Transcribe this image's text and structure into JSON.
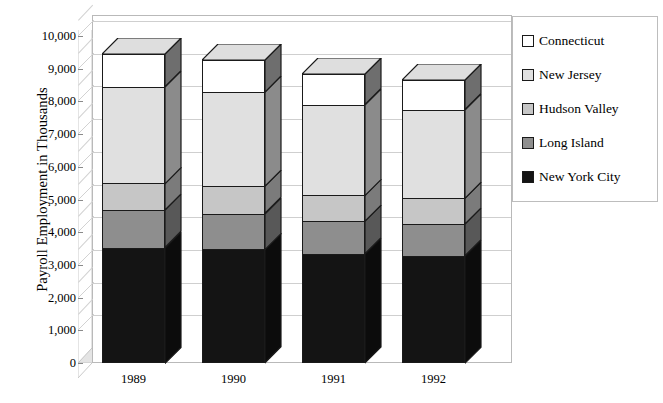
{
  "chart_data": {
    "type": "bar",
    "subtype": "stacked-3d-column",
    "title": "",
    "xlabel": "",
    "ylabel": "Payroll Employment in Thousands",
    "categories": [
      "1989",
      "1990",
      "1991",
      "1992"
    ],
    "ylim": [
      0,
      10000
    ],
    "ytick_labels": [
      "0",
      "1,000",
      "2,000",
      "3,000",
      "4,000",
      "5,000",
      "6,000",
      "7,000",
      "8,000",
      "9,000",
      "10,000"
    ],
    "ytick_values": [
      0,
      1000,
      2000,
      3000,
      4000,
      5000,
      6000,
      7000,
      8000,
      9000,
      10000
    ],
    "grid": true,
    "legend_position": "right",
    "stack_order_bottom_to_top": [
      "New York City",
      "Long Island",
      "Hudson Valley",
      "New Jersey",
      "Connecticut"
    ],
    "series": [
      {
        "name": "New York City",
        "color": "#141414",
        "values": [
          3530,
          3480,
          3330,
          3280
        ]
      },
      {
        "name": "Long Island",
        "color": "#8e8e8e",
        "values": [
          1140,
          1090,
          1000,
          970
        ]
      },
      {
        "name": "Hudson Valley",
        "color": "#c6c6c6",
        "values": [
          820,
          830,
          800,
          790
        ]
      },
      {
        "name": "New Jersey",
        "color": "#e0e0e0",
        "values": [
          2960,
          2880,
          2770,
          2700
        ]
      },
      {
        "name": "Connecticut",
        "color": "#ffffff",
        "values": [
          1000,
          980,
          930,
          900
        ]
      }
    ],
    "totals": [
      9450,
      9260,
      8830,
      8640
    ]
  },
  "legend": {
    "items": [
      {
        "label": "Connecticut",
        "color": "#ffffff"
      },
      {
        "label": "New Jersey",
        "color": "#e0e0e0"
      },
      {
        "label": "Hudson Valley",
        "color": "#c6c6c6"
      },
      {
        "label": "Long Island",
        "color": "#8e8e8e"
      },
      {
        "label": "New York City",
        "color": "#141414"
      }
    ]
  },
  "axis": {
    "y_title": "Payroll Employment in Thousands"
  }
}
